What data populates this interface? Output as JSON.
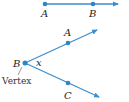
{
  "colors": {
    "line": "#3a8fd0",
    "point": "#2e84c8",
    "text": "#222222"
  },
  "ray_top": {
    "point_a_label": "A",
    "point_b_label": "B"
  },
  "angle": {
    "vertex_label": "B",
    "point_a_label": "A",
    "point_c_label": "C",
    "angle_label": "x",
    "vertex_caption": "Vertex"
  }
}
